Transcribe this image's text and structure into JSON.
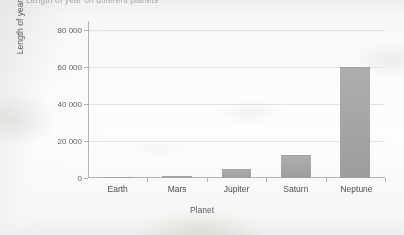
{
  "chart_data": {
    "type": "bar",
    "title": "Length of year on different planets",
    "xlabel": "Planet",
    "ylabel": "Length of year (days)",
    "categories": [
      "Earth",
      "Mars",
      "Jupiter",
      "Saturn",
      "Neptune"
    ],
    "values": [
      365,
      1100,
      5000,
      12300,
      60200
    ],
    "series": [
      {
        "name": "Length of year (days)",
        "values": [
          365,
          1100,
          5000,
          12300,
          60200
        ]
      }
    ],
    "ylim": [
      0,
      85000
    ],
    "yticks": [
      0,
      20000,
      40000,
      60000,
      80000
    ],
    "ytick_labels": [
      "0",
      "20 000",
      "40 000",
      "60 000",
      "80 000"
    ],
    "grid": true,
    "legend": false,
    "bar_color": "#a6a6a6",
    "gridline_color": "#e2e2e0",
    "axis_color": "#b4b4b2",
    "background_color": "#fbfbfa"
  }
}
